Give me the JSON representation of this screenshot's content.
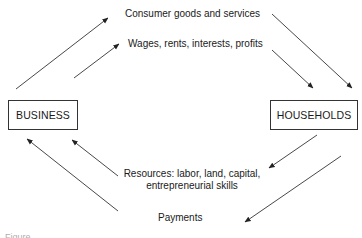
{
  "diagram": {
    "type": "circular-flow",
    "nodes": {
      "business": {
        "label": "BUSINESS"
      },
      "households": {
        "label": "HOUSEHOLDS"
      }
    },
    "flows": {
      "top_outer": {
        "label": "Consumer goods and services",
        "from": "business",
        "to": "households"
      },
      "top_inner": {
        "label": "Wages, rents, interests, profits",
        "from": "business",
        "to": "households"
      },
      "bottom_inner": {
        "label_line1": "Resources: labor, land, capital,",
        "label_line2": "entrepreneurial skills",
        "from": "households",
        "to": "business"
      },
      "bottom_outer": {
        "label": "Payments",
        "from": "households",
        "to": "business"
      }
    },
    "caption": "Figure"
  }
}
